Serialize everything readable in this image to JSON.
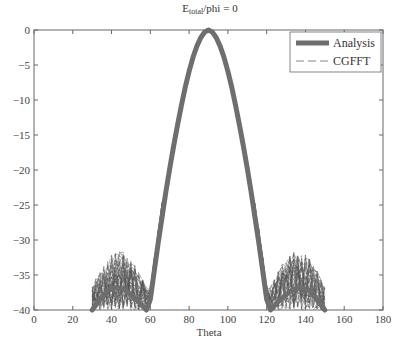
{
  "chart_data": {
    "type": "line",
    "title_main": "E",
    "title_sub": "total",
    "title_rest": "/phi = 0",
    "xlabel": "Theta",
    "ylabel": "",
    "xlim": [
      0,
      180
    ],
    "ylim": [
      -40,
      0
    ],
    "xticks": [
      0,
      20,
      40,
      60,
      80,
      100,
      120,
      140,
      160,
      180
    ],
    "yticks": [
      0,
      -5,
      -10,
      -15,
      -20,
      -25,
      -30,
      -35,
      -40
    ],
    "grid": false,
    "legend_position": "upper right",
    "series": [
      {
        "name": "Analysis",
        "style": "thick solid",
        "color": "#6e6e6e",
        "x": [
          30,
          34,
          38,
          42,
          46,
          50,
          54,
          58,
          60,
          62,
          64,
          66,
          68,
          70,
          72,
          74,
          76,
          78,
          80,
          82,
          84,
          86,
          88,
          90,
          92,
          94,
          96,
          98,
          100,
          102,
          104,
          106,
          108,
          110,
          112,
          114,
          116,
          118,
          120,
          122,
          126,
          130,
          134,
          138,
          142,
          146,
          150
        ],
        "y": [
          -40,
          -38.5,
          -37.2,
          -36.8,
          -37.0,
          -37.8,
          -38.8,
          -40,
          -38.5,
          -34.5,
          -30.5,
          -26.8,
          -23.2,
          -19.8,
          -16.6,
          -13.6,
          -10.8,
          -8.2,
          -5.9,
          -3.9,
          -2.3,
          -1.1,
          -0.3,
          0,
          -0.3,
          -1.1,
          -2.3,
          -3.9,
          -5.9,
          -8.2,
          -10.8,
          -13.6,
          -16.6,
          -19.8,
          -23.2,
          -26.8,
          -30.5,
          -34.5,
          -38.5,
          -40,
          -38.8,
          -37.8,
          -37.0,
          -36.8,
          -37.2,
          -38.5,
          -40
        ]
      },
      {
        "name": "CGFFT",
        "style": "thin dashed (many realizations)",
        "color": "#555555",
        "note": "dense bundle of curves following main lobe, sidelobe region scattered between -40 and about -31 dB for theta 30-62 and 118-150"
      }
    ]
  },
  "legend": {
    "items": [
      {
        "label": "Analysis"
      },
      {
        "label": "CGFFT"
      }
    ]
  },
  "axes": {
    "x_tick_labels": [
      "0",
      "20",
      "40",
      "60",
      "80",
      "100",
      "120",
      "140",
      "160",
      "180"
    ],
    "y_tick_labels": [
      "0",
      "-5",
      "-10",
      "-15",
      "-20",
      "-25",
      "-30",
      "-35",
      "-40"
    ],
    "xlabel": "Theta"
  },
  "colors": {
    "analysis": "#6e6e6e",
    "cgfft": "#555555",
    "axis": "#555555"
  }
}
